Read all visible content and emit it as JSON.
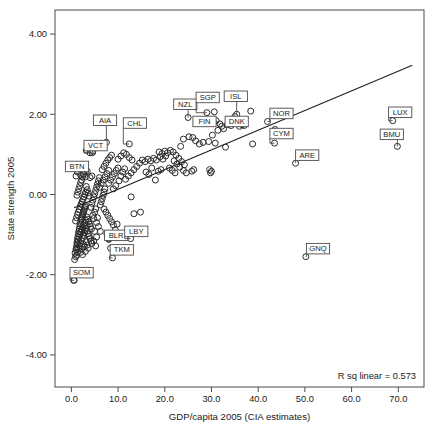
{
  "chart_data": {
    "type": "scatter",
    "title": "",
    "xlabel": "GDP/capita 2005 (CIA estimates)",
    "ylabel": "State strength 2005",
    "xlim": [
      -3.5,
      75.5
    ],
    "ylim": [
      -4.8,
      4.6
    ],
    "xticks": [
      "0.0",
      "10.0",
      "20.0",
      "30.0",
      "40.0",
      "50.0",
      "60.0",
      "70.0"
    ],
    "xtick_values": [
      0,
      10,
      20,
      30,
      40,
      50,
      60,
      70
    ],
    "yticks": [
      "4.00",
      "2.00",
      "0.00",
      "-2.00",
      "-4.00"
    ],
    "ytick_values": [
      4,
      2,
      0,
      -2,
      -4
    ],
    "grid": false,
    "legend": "none",
    "annotation": "R sq linear = 0.573",
    "r_squared": 0.573,
    "fit_line": {
      "x0": 0.6,
      "y0": -0.33,
      "x1": 73.0,
      "y1": 3.22
    },
    "marker": {
      "shape": "open-circle",
      "radius": 3.0,
      "stroke": "#2b2b2b",
      "fill": "none"
    },
    "colors": {
      "axis": "#4a4a4a",
      "marker": "#2b2b2b",
      "line": "#1e1e1e",
      "label_box": "#ffffff",
      "text": "#1a1a1a"
    },
    "labeled_points": [
      {
        "code": "AIA",
        "x": 7.5,
        "y": 1.3,
        "lx": 7.2,
        "ly": 1.85
      },
      {
        "code": "CHL",
        "x": 12.4,
        "y": 1.26,
        "lx": 13.6,
        "ly": 1.78
      },
      {
        "code": "VCT",
        "x": 4.5,
        "y": 1.04,
        "lx": 5.2,
        "ly": 1.22
      },
      {
        "code": "BTN",
        "x": 3.0,
        "y": 0.57,
        "lx": 1.2,
        "ly": 0.7
      },
      {
        "code": "NZL",
        "x": 25.0,
        "y": 1.92,
        "lx": 24.4,
        "ly": 2.25
      },
      {
        "code": "SGP",
        "x": 29.0,
        "y": 2.04,
        "lx": 29.2,
        "ly": 2.42
      },
      {
        "code": "FIN",
        "x": 30.5,
        "y": 1.79,
        "lx": 28.5,
        "ly": 1.82
      },
      {
        "code": "ISL",
        "x": 35.4,
        "y": 2.0,
        "lx": 35.2,
        "ly": 2.45
      },
      {
        "code": "DNK",
        "x": 34.2,
        "y": 1.72,
        "lx": 35.4,
        "ly": 1.82
      },
      {
        "code": "NOR",
        "x": 42.0,
        "y": 1.82,
        "lx": 45.0,
        "ly": 2.02
      },
      {
        "code": "CYM",
        "x": 43.5,
        "y": 1.28,
        "lx": 45.0,
        "ly": 1.52
      },
      {
        "code": "LUX",
        "x": 68.8,
        "y": 1.84,
        "lx": 70.4,
        "ly": 2.05
      },
      {
        "code": "BMU",
        "x": 69.8,
        "y": 1.2,
        "lx": 68.6,
        "ly": 1.5
      },
      {
        "code": "ARE",
        "x": 48.0,
        "y": 0.78,
        "lx": 50.5,
        "ly": 0.98
      },
      {
        "code": "BLR",
        "x": 8.0,
        "y": -1.1,
        "lx": 9.6,
        "ly": -1.02
      },
      {
        "code": "LBY",
        "x": 12.7,
        "y": -1.1,
        "lx": 13.9,
        "ly": -0.92
      },
      {
        "code": "TKM",
        "x": 8.8,
        "y": -1.58,
        "lx": 10.8,
        "ly": -1.38
      },
      {
        "code": "GNQ",
        "x": 50.2,
        "y": -1.55,
        "lx": 52.8,
        "ly": -1.35
      },
      {
        "code": "SOM",
        "x": 0.6,
        "y": -2.14,
        "lx": 2.2,
        "ly": -1.95
      }
    ],
    "points": [
      [
        0.5,
        -2.14
      ],
      [
        0.7,
        -1.62
      ],
      [
        0.9,
        -1.55
      ],
      [
        1.0,
        -1.38
      ],
      [
        1.1,
        -1.3
      ],
      [
        1.2,
        -1.2
      ],
      [
        1.3,
        -1.12
      ],
      [
        1.4,
        -1.05
      ],
      [
        1.5,
        -0.98
      ],
      [
        1.6,
        -0.92
      ],
      [
        1.7,
        -0.86
      ],
      [
        1.8,
        -0.8
      ],
      [
        1.9,
        -0.74
      ],
      [
        2.0,
        -0.7
      ],
      [
        2.1,
        -0.64
      ],
      [
        2.2,
        -0.6
      ],
      [
        2.3,
        -0.56
      ],
      [
        2.4,
        -0.52
      ],
      [
        2.5,
        -0.48
      ],
      [
        2.6,
        -0.44
      ],
      [
        2.7,
        -0.4
      ],
      [
        2.8,
        -0.36
      ],
      [
        2.9,
        -0.32
      ],
      [
        3.0,
        -0.28
      ],
      [
        0.8,
        -1.46
      ],
      [
        1.05,
        -1.34
      ],
      [
        1.25,
        -1.24
      ],
      [
        1.45,
        -1.16
      ],
      [
        1.65,
        -1.08
      ],
      [
        1.85,
        -1.0
      ],
      [
        2.05,
        -0.94
      ],
      [
        2.25,
        -0.88
      ],
      [
        2.45,
        -0.82
      ],
      [
        2.65,
        -0.76
      ],
      [
        2.85,
        -0.7
      ],
      [
        3.05,
        -0.64
      ],
      [
        1.15,
        -1.52
      ],
      [
        1.35,
        -1.44
      ],
      [
        1.55,
        -1.36
      ],
      [
        1.75,
        -1.28
      ],
      [
        1.95,
        -1.22
      ],
      [
        2.15,
        -1.15
      ],
      [
        2.35,
        -1.08
      ],
      [
        2.55,
        -1.02
      ],
      [
        2.75,
        -0.96
      ],
      [
        2.95,
        -0.9
      ],
      [
        3.15,
        -0.84
      ],
      [
        3.35,
        -0.78
      ],
      [
        0.9,
        -0.66
      ],
      [
        1.1,
        -0.58
      ],
      [
        1.3,
        -0.5
      ],
      [
        1.5,
        -0.44
      ],
      [
        1.7,
        -0.38
      ],
      [
        1.9,
        -0.3
      ],
      [
        2.1,
        -0.24
      ],
      [
        2.3,
        -0.18
      ],
      [
        2.5,
        -0.12
      ],
      [
        2.7,
        -0.06
      ],
      [
        2.9,
        0.0
      ],
      [
        3.1,
        0.06
      ],
      [
        1.2,
        -0.02
      ],
      [
        1.4,
        0.06
      ],
      [
        1.6,
        0.14
      ],
      [
        1.8,
        0.22
      ],
      [
        2.0,
        0.3
      ],
      [
        2.2,
        0.36
      ],
      [
        2.4,
        0.44
      ],
      [
        2.6,
        0.5
      ],
      [
        3.2,
        0.2
      ],
      [
        3.4,
        0.12
      ],
      [
        3.6,
        0.04
      ],
      [
        3.8,
        -0.04
      ],
      [
        3.3,
        -0.56
      ],
      [
        3.5,
        -0.62
      ],
      [
        3.7,
        -0.68
      ],
      [
        3.9,
        -0.74
      ],
      [
        4.1,
        -0.8
      ],
      [
        4.3,
        -0.86
      ],
      [
        3.4,
        -0.92
      ],
      [
        3.6,
        -0.98
      ],
      [
        3.8,
        -1.04
      ],
      [
        4.0,
        -1.1
      ],
      [
        4.2,
        -1.16
      ],
      [
        4.4,
        -1.22
      ],
      [
        2.0,
        -1.44
      ],
      [
        2.2,
        -1.36
      ],
      [
        2.4,
        -1.5
      ],
      [
        2.6,
        -1.24
      ],
      [
        2.8,
        -1.3
      ],
      [
        3.0,
        -1.42
      ],
      [
        3.2,
        -1.18
      ],
      [
        3.4,
        -1.26
      ],
      [
        3.6,
        -1.34
      ],
      [
        1.0,
        0.46
      ],
      [
        1.3,
        0.56
      ],
      [
        2.0,
        0.48
      ],
      [
        2.6,
        0.52
      ],
      [
        3.0,
        0.44
      ],
      [
        3.4,
        0.58
      ],
      [
        4.0,
        0.42
      ],
      [
        4.4,
        0.46
      ],
      [
        4.0,
        1.04
      ],
      [
        3.2,
        1.1
      ],
      [
        4.6,
        1.08
      ],
      [
        4.2,
        -0.32
      ],
      [
        4.4,
        -0.22
      ],
      [
        4.6,
        -0.14
      ],
      [
        4.8,
        -0.06
      ],
      [
        5.0,
        0.02
      ],
      [
        5.2,
        0.1
      ],
      [
        5.4,
        0.18
      ],
      [
        5.6,
        0.26
      ],
      [
        5.8,
        0.34
      ],
      [
        6.0,
        0.42
      ],
      [
        4.6,
        -0.52
      ],
      [
        4.8,
        -0.6
      ],
      [
        5.0,
        -0.44
      ],
      [
        5.2,
        -0.36
      ],
      [
        5.4,
        -0.7
      ],
      [
        5.6,
        -0.58
      ],
      [
        5.0,
        -0.92
      ],
      [
        5.4,
        -1.06
      ],
      [
        5.8,
        -0.8
      ],
      [
        6.2,
        -0.92
      ],
      [
        4.8,
        -1.16
      ],
      [
        5.2,
        -1.28
      ],
      [
        6.2,
        -0.26
      ],
      [
        6.4,
        -0.18
      ],
      [
        6.6,
        -0.1
      ],
      [
        6.8,
        -0.02
      ],
      [
        7.0,
        0.06
      ],
      [
        7.2,
        0.14
      ],
      [
        6.0,
        0.18
      ],
      [
        6.4,
        0.28
      ],
      [
        6.8,
        0.36
      ],
      [
        7.2,
        0.44
      ],
      [
        7.6,
        0.52
      ],
      [
        8.0,
        0.6
      ],
      [
        6.6,
        0.62
      ],
      [
        7.0,
        0.7
      ],
      [
        7.4,
        0.78
      ],
      [
        7.8,
        0.86
      ],
      [
        8.2,
        0.92
      ],
      [
        8.6,
        0.98
      ],
      [
        7.0,
        -0.36
      ],
      [
        7.4,
        -0.44
      ],
      [
        7.8,
        -0.52
      ],
      [
        8.2,
        -0.6
      ],
      [
        8.6,
        -0.68
      ],
      [
        9.0,
        -0.76
      ],
      [
        7.6,
        -0.98
      ],
      [
        8.0,
        -1.12
      ],
      [
        8.4,
        -1.34
      ],
      [
        9.0,
        -1.04
      ],
      [
        9.4,
        -0.88
      ],
      [
        9.8,
        -0.74
      ],
      [
        8.0,
        0.28
      ],
      [
        8.4,
        0.36
      ],
      [
        8.8,
        0.44
      ],
      [
        9.2,
        0.52
      ],
      [
        9.6,
        0.6
      ],
      [
        10.0,
        0.66
      ],
      [
        9.0,
        0.14
      ],
      [
        9.5,
        0.22
      ],
      [
        10.2,
        0.34
      ],
      [
        10.6,
        0.46
      ],
      [
        11.0,
        0.56
      ],
      [
        11.4,
        0.64
      ],
      [
        10.0,
        0.88
      ],
      [
        10.6,
        0.96
      ],
      [
        11.2,
        1.04
      ],
      [
        11.8,
        1.0
      ],
      [
        12.4,
        0.92
      ],
      [
        13.0,
        0.86
      ],
      [
        12.8,
        -0.06
      ],
      [
        13.4,
        -0.48
      ],
      [
        14.8,
        -0.44
      ],
      [
        11.6,
        0.38
      ],
      [
        12.2,
        0.46
      ],
      [
        12.8,
        0.54
      ],
      [
        13.4,
        0.62
      ],
      [
        14.0,
        0.7
      ],
      [
        14.6,
        0.78
      ],
      [
        15.2,
        0.86
      ],
      [
        15.8,
        0.82
      ],
      [
        16.4,
        0.88
      ],
      [
        17.0,
        0.84
      ],
      [
        17.6,
        0.9
      ],
      [
        18.2,
        0.86
      ],
      [
        18.8,
        1.06
      ],
      [
        19.4,
        1.02
      ],
      [
        20.0,
        1.08
      ],
      [
        20.6,
        1.04
      ],
      [
        21.2,
        1.1
      ],
      [
        21.8,
        1.06
      ],
      [
        19.0,
        0.94
      ],
      [
        19.6,
        0.88
      ],
      [
        20.2,
        0.96
      ],
      [
        18.0,
        0.36
      ],
      [
        18.6,
        0.58
      ],
      [
        19.2,
        0.62
      ],
      [
        16.0,
        0.56
      ],
      [
        16.6,
        0.5
      ],
      [
        17.2,
        0.66
      ],
      [
        22.4,
        0.98
      ],
      [
        23.0,
        0.9
      ],
      [
        23.6,
        0.82
      ],
      [
        24.2,
        0.74
      ],
      [
        22.0,
        0.84
      ],
      [
        22.6,
        0.76
      ],
      [
        21.0,
        0.66
      ],
      [
        21.6,
        0.6
      ],
      [
        22.2,
        0.54
      ],
      [
        23.2,
        0.68
      ],
      [
        24.0,
        0.6
      ],
      [
        24.6,
        0.54
      ],
      [
        25.2,
        1.44
      ],
      [
        26.6,
        1.34
      ],
      [
        24.0,
        1.38
      ],
      [
        23.4,
        1.2
      ],
      [
        25.8,
        0.58
      ],
      [
        26.2,
        0.62
      ],
      [
        29.4,
        1.32
      ],
      [
        30.2,
        1.48
      ],
      [
        30.8,
        1.28
      ],
      [
        29.8,
        0.54
      ],
      [
        29.6,
        0.62
      ],
      [
        30.0,
        0.58
      ],
      [
        31.4,
        1.6
      ],
      [
        31.8,
        1.76
      ],
      [
        32.2,
        1.7
      ],
      [
        32.6,
        1.64
      ],
      [
        33.0,
        1.18
      ],
      [
        33.4,
        1.74
      ],
      [
        30.6,
        2.06
      ],
      [
        31.0,
        1.84
      ],
      [
        33.8,
        1.8
      ],
      [
        34.6,
        1.78
      ],
      [
        35.0,
        1.94
      ],
      [
        36.0,
        1.7
      ],
      [
        36.6,
        1.74
      ],
      [
        37.0,
        1.72
      ],
      [
        38.4,
        2.08
      ],
      [
        38.8,
        1.26
      ],
      [
        43.2,
        1.58
      ],
      [
        43.6,
        1.62
      ],
      [
        26.0,
        1.42
      ],
      [
        27.4,
        1.26
      ],
      [
        28.2,
        1.3
      ]
    ]
  }
}
